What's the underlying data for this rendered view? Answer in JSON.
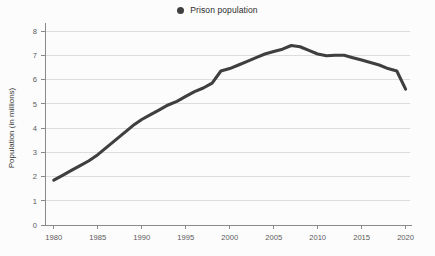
{
  "legend": {
    "position": "top-center",
    "marker_icon": "filled-circle-icon",
    "entries": [
      {
        "label": "Prison population",
        "color": "#3f3f3f"
      }
    ]
  },
  "colors": {
    "series": "#3f3f3f",
    "gridline": "#dddddd",
    "axis": "#8a8a8a",
    "background": "#fcfcfc",
    "tick_text": "#5a5a5a"
  },
  "chart_data": {
    "type": "line",
    "title": "",
    "subtitle": "",
    "xlabel": "",
    "ylabel": "Population (in millions)",
    "xlim": [
      1979,
      2020.5
    ],
    "ylim": [
      0,
      8.3
    ],
    "grid": true,
    "legend_position": "top-center",
    "x_ticks": [
      "1980",
      "1985",
      "1990",
      "1995",
      "2000",
      "2005",
      "2010",
      "2015",
      "2020"
    ],
    "y_ticks": [
      "0",
      "1",
      "2",
      "3",
      "4",
      "5",
      "6",
      "7",
      "8"
    ],
    "series": [
      {
        "name": "Prison population",
        "color": "#3f3f3f",
        "x": [
          1980,
          1981,
          1982,
          1983,
          1984,
          1985,
          1986,
          1987,
          1988,
          1989,
          1990,
          1991,
          1992,
          1993,
          1994,
          1995,
          1996,
          1997,
          1998,
          1999,
          2000,
          2001,
          2002,
          2003,
          2004,
          2005,
          2006,
          2007,
          2008,
          2009,
          2010,
          2011,
          2012,
          2013,
          2014,
          2015,
          2016,
          2017,
          2018,
          2019,
          2020
        ],
        "values": [
          1.85,
          2.05,
          2.25,
          2.45,
          2.65,
          2.9,
          3.2,
          3.5,
          3.8,
          4.1,
          4.35,
          4.55,
          4.75,
          4.95,
          5.1,
          5.3,
          5.5,
          5.65,
          5.85,
          6.35,
          6.45,
          6.6,
          6.75,
          6.9,
          7.05,
          7.15,
          7.25,
          7.4,
          7.35,
          7.2,
          7.05,
          6.98,
          7.0,
          7.0,
          6.9,
          6.8,
          6.7,
          6.6,
          6.45,
          6.35,
          5.6
        ]
      }
    ]
  }
}
